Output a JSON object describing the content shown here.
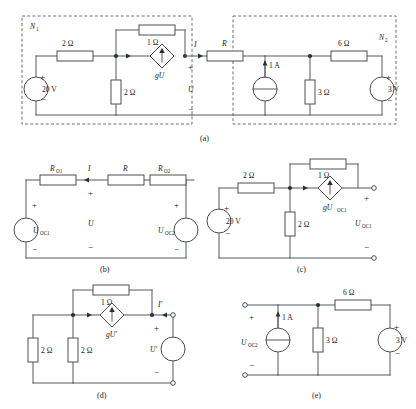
{
  "figure": {
    "captions": {
      "a": "(a)",
      "b": "(b)",
      "c": "(c)",
      "d": "(d)",
      "e": "(e)"
    },
    "colors": {
      "wire": "#555a5e",
      "dashed_box": "#6a6f73",
      "component_outline": "#4a4f53",
      "node_dot": "#2c3033",
      "text": "#1a1a1a",
      "background": "#ffffff"
    }
  },
  "panel_a": {
    "network_left_label": "N",
    "network_left_sub": "1",
    "network_right_label": "N",
    "network_right_sub": "2",
    "source_20v": "20 V",
    "res_series_2ohm": "2 Ω",
    "res_shunt_2ohm": "2 Ω",
    "res_feedback_1ohm": "1 Ω",
    "dep_source": "gU",
    "port_voltage": "U",
    "port_current": "I",
    "res_R": "R",
    "source_1a": "1 A",
    "res_3ohm": "3 Ω",
    "res_6ohm": "6 Ω",
    "source_3v": "3 V",
    "plus": "+",
    "minus": "−"
  },
  "panel_b": {
    "res_o1": "R",
    "res_o1_sub": "O1",
    "res_o2": "R",
    "res_o2_sub": "O2",
    "res_R": "R",
    "current_I": "I",
    "voltage_U": "U",
    "src_left": "U",
    "src_left_sub": "OC1",
    "src_right": "U",
    "src_right_sub": "OC2",
    "plus": "+",
    "minus": "−"
  },
  "panel_c": {
    "source_20v": "20 V",
    "res_series_2ohm": "2 Ω",
    "res_shunt_2ohm": "2 Ω",
    "res_feedback_1ohm": "1 Ω",
    "dep_source": "gU",
    "dep_source_sub": "OC1",
    "out_voltage": "U",
    "out_voltage_sub": "OC1",
    "plus": "+",
    "minus": "−"
  },
  "panel_d": {
    "res_left_2ohm": "2 Ω",
    "res_mid_2ohm": "2 Ω",
    "res_feedback_1ohm": "1 Ω",
    "dep_source": "gU′",
    "test_voltage": "U′",
    "test_current": "I′",
    "plus": "+",
    "minus": "−"
  },
  "panel_e": {
    "out_voltage": "U",
    "out_voltage_sub": "OC2",
    "source_1a": "1 A",
    "res_3ohm": "3 Ω",
    "res_6ohm": "6 Ω",
    "source_3v": "3 V",
    "plus": "+",
    "minus": "−"
  }
}
